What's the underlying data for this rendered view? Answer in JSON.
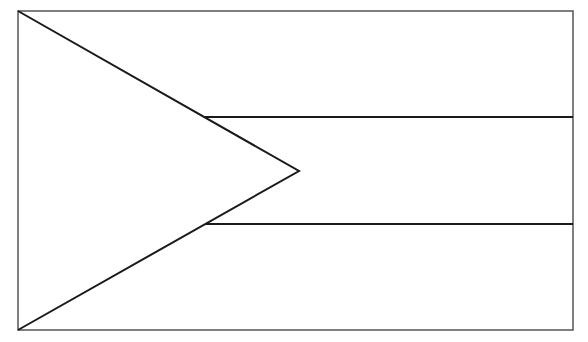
{
  "diagram": {
    "type": "flag-outline",
    "background": "#ffffff",
    "stroke_color": "#1a1a1a",
    "border_color": "#555555",
    "frame": {
      "x": 18,
      "y": 11,
      "width": 555,
      "height": 319
    },
    "stripes": [
      {
        "y": 117
      },
      {
        "y": 224
      }
    ],
    "triangle": {
      "points": [
        [
          18,
          11
        ],
        [
          299,
          171
        ],
        [
          18,
          330
        ]
      ]
    }
  }
}
